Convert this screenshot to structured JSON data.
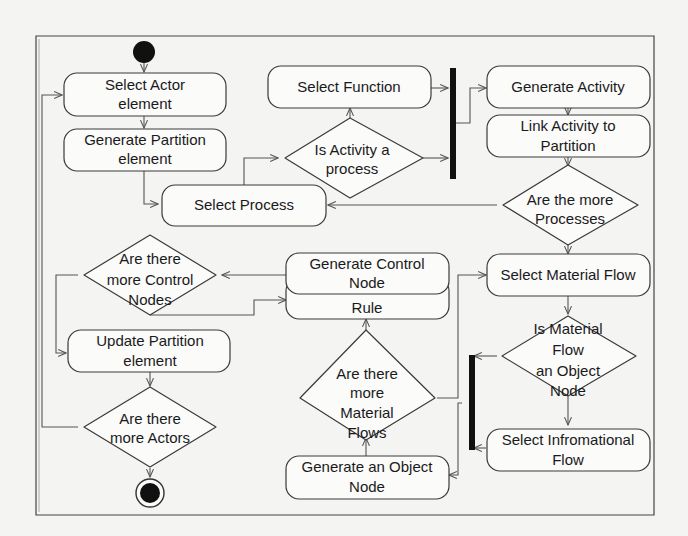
{
  "diagram": {
    "type": "uml-activity-diagram",
    "start_node": "initial-node",
    "end_node": "final-node",
    "nodes": [
      {
        "id": "select-actor",
        "kind": "action",
        "lines": [
          "Select Actor",
          "element"
        ]
      },
      {
        "id": "generate-partition",
        "kind": "action",
        "lines": [
          "Generate Partition",
          "element"
        ]
      },
      {
        "id": "select-process",
        "kind": "action",
        "lines": [
          "Select Process"
        ]
      },
      {
        "id": "is-activity-process",
        "kind": "decision",
        "lines": [
          "Is Activity a",
          "process"
        ]
      },
      {
        "id": "select-function",
        "kind": "action",
        "lines": [
          "Select Function"
        ]
      },
      {
        "id": "fork-top",
        "kind": "fork-bar"
      },
      {
        "id": "generate-activity",
        "kind": "action",
        "lines": [
          "Generate Activity"
        ]
      },
      {
        "id": "link-activity",
        "kind": "action",
        "lines": [
          "Link Activity to",
          "Partition"
        ]
      },
      {
        "id": "more-processes",
        "kind": "decision",
        "lines": [
          "Are the more",
          "Processes"
        ]
      },
      {
        "id": "select-material-flow",
        "kind": "action",
        "lines": [
          "Select Material Flow"
        ]
      },
      {
        "id": "is-material-object",
        "kind": "decision",
        "lines": [
          "Is Material",
          "Flow",
          "an Object",
          "Node"
        ]
      },
      {
        "id": "select-info-flow",
        "kind": "action",
        "lines": [
          "Select Infromational",
          "Flow"
        ]
      },
      {
        "id": "join-bottom",
        "kind": "join-bar"
      },
      {
        "id": "generate-object-node",
        "kind": "action",
        "lines": [
          "Generate an Object",
          "Node"
        ]
      },
      {
        "id": "more-material-flows",
        "kind": "decision",
        "lines": [
          "Are there",
          "more",
          "Material",
          "Flows"
        ]
      },
      {
        "id": "select-business-rule",
        "kind": "action",
        "lines": [
          "Select Business",
          "Rule"
        ]
      },
      {
        "id": "generate-control-node",
        "kind": "action",
        "lines": [
          "Generate Control",
          "Node"
        ]
      },
      {
        "id": "more-control-nodes",
        "kind": "decision",
        "lines": [
          "Are there",
          "more Control",
          "Nodes"
        ]
      },
      {
        "id": "update-partition",
        "kind": "action",
        "lines": [
          "Update Partition",
          "element"
        ]
      },
      {
        "id": "more-actors",
        "kind": "decision",
        "lines": [
          "Are there",
          "more Actors"
        ]
      }
    ],
    "edges": [
      [
        "initial-node",
        "select-actor"
      ],
      [
        "select-actor",
        "generate-partition"
      ],
      [
        "generate-partition",
        "select-process"
      ],
      [
        "select-process",
        "is-activity-process"
      ],
      [
        "is-activity-process",
        "select-function"
      ],
      [
        "is-activity-process",
        "fork-top"
      ],
      [
        "select-function",
        "fork-top"
      ],
      [
        "fork-top",
        "generate-activity"
      ],
      [
        "generate-activity",
        "link-activity"
      ],
      [
        "link-activity",
        "more-processes"
      ],
      [
        "more-processes",
        "select-process"
      ],
      [
        "more-processes",
        "select-material-flow"
      ],
      [
        "select-material-flow",
        "is-material-object"
      ],
      [
        "is-material-object",
        "join-bottom"
      ],
      [
        "is-material-object",
        "select-info-flow"
      ],
      [
        "select-info-flow",
        "join-bottom"
      ],
      [
        "join-bottom",
        "generate-object-node"
      ],
      [
        "generate-object-node",
        "more-material-flows"
      ],
      [
        "more-material-flows",
        "select-material-flow"
      ],
      [
        "more-material-flows",
        "select-business-rule"
      ],
      [
        "select-business-rule",
        "generate-control-node"
      ],
      [
        "generate-control-node",
        "more-control-nodes"
      ],
      [
        "more-control-nodes",
        "select-business-rule"
      ],
      [
        "more-control-nodes",
        "update-partition"
      ],
      [
        "update-partition",
        "more-actors"
      ],
      [
        "more-actors",
        "select-actor"
      ],
      [
        "more-actors",
        "final-node"
      ]
    ]
  },
  "labels": {
    "select_actor": [
      "Select Actor",
      "element"
    ],
    "generate_partition": [
      "Generate Partition",
      "element"
    ],
    "select_process": [
      "Select Process"
    ],
    "is_activity_process": [
      "Is Activity a",
      "process"
    ],
    "select_function": [
      "Select Function"
    ],
    "generate_activity": [
      "Generate Activity"
    ],
    "link_activity": [
      "Link Activity to",
      "Partition"
    ],
    "more_processes": [
      "Are the more",
      "Processes"
    ],
    "select_material_flow": [
      "Select Material Flow"
    ],
    "is_material_object": [
      "Is Material",
      "Flow",
      "an Object",
      "Node"
    ],
    "select_info_flow": [
      "Select Infromational",
      "Flow"
    ],
    "generate_object_node": [
      "Generate an Object",
      "Node"
    ],
    "more_material_flows": [
      "Are there",
      "more",
      "Material",
      "Flows"
    ],
    "select_business_rule": [
      "Select Business",
      "Rule"
    ],
    "generate_control_node": [
      "Generate Control",
      "Node"
    ],
    "more_control_nodes": [
      "Are there",
      "more Control",
      "Nodes"
    ],
    "update_partition": [
      "Update Partition",
      "element"
    ],
    "more_actors": [
      "Are there",
      "more Actors"
    ]
  },
  "colors": {
    "background": "#f4f4f2",
    "node_fill": "#fbfbfa",
    "stroke": "#3a3a3a",
    "bar": "#111111",
    "text": "#1a1a1a"
  }
}
